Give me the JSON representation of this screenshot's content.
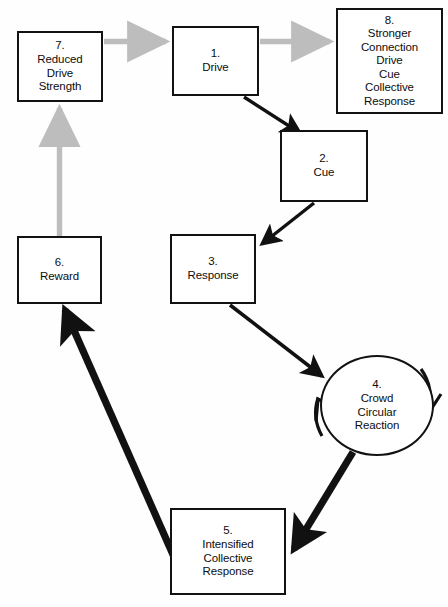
{
  "diagram": {
    "background_color": "#fefefe",
    "node_border_color": "#121212",
    "black_arrow_color": "#111111",
    "gray_arrow_color": "#bdbdbd",
    "nodes": [
      {
        "id": "node-1",
        "shape": "rect",
        "number": "1.",
        "lines": [
          "Drive"
        ]
      },
      {
        "id": "node-2",
        "shape": "rect",
        "number": "2.",
        "lines": [
          "Cue"
        ]
      },
      {
        "id": "node-3",
        "shape": "rect",
        "number": "3.",
        "lines": [
          "Response"
        ]
      },
      {
        "id": "node-4",
        "shape": "circle",
        "number": "4.",
        "lines": [
          "Crowd",
          "Circular",
          "Reaction"
        ]
      },
      {
        "id": "node-5",
        "shape": "rect",
        "number": "5.",
        "lines": [
          "Intensified",
          "Collective",
          "Response"
        ]
      },
      {
        "id": "node-6",
        "shape": "rect",
        "number": "6.",
        "lines": [
          "Reward"
        ]
      },
      {
        "id": "node-7",
        "shape": "rect",
        "number": "7.",
        "lines": [
          "Reduced",
          "Drive",
          "Strength"
        ]
      },
      {
        "id": "node-8",
        "shape": "rect",
        "number": "8.",
        "lines": [
          "Stronger",
          "Connection",
          "Drive",
          "Cue",
          "Collective",
          "Response"
        ]
      }
    ],
    "edges": [
      {
        "id": "edge-7-to-1",
        "from": "node-7",
        "to": "node-1",
        "style": "gray"
      },
      {
        "id": "edge-1-to-8",
        "from": "node-1",
        "to": "node-8",
        "style": "gray"
      },
      {
        "id": "edge-6-to-7",
        "from": "node-6",
        "to": "node-7",
        "style": "gray"
      },
      {
        "id": "edge-1-to-2",
        "from": "node-1",
        "to": "node-2",
        "style": "black-thin"
      },
      {
        "id": "edge-2-to-3",
        "from": "node-2",
        "to": "node-3",
        "style": "black-thin"
      },
      {
        "id": "edge-3-to-4",
        "from": "node-3",
        "to": "node-4",
        "style": "black-thin"
      },
      {
        "id": "edge-4-to-5",
        "from": "node-4",
        "to": "node-5",
        "style": "black-thick"
      },
      {
        "id": "edge-5-to-6",
        "from": "node-5",
        "to": "node-6",
        "style": "black-thick"
      },
      {
        "id": "edge-4-self-right",
        "from": "node-4",
        "to": "node-4",
        "style": "black-arc"
      },
      {
        "id": "edge-4-self-left",
        "from": "node-4",
        "to": "node-4",
        "style": "black-arc"
      }
    ]
  }
}
